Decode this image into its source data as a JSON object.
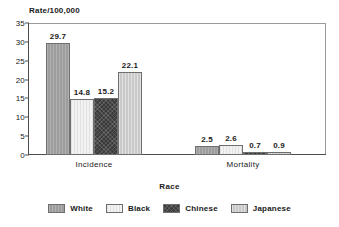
{
  "chart_data": {
    "type": "bar",
    "title": "",
    "xlabel": "Race",
    "ylabel": "Rate/100,000",
    "categories": [
      "Incidence",
      "Mortality"
    ],
    "series": [
      {
        "name": "White",
        "values": [
          29.7,
          2.5
        ],
        "color": "#9d9d9d",
        "pattern": "vertical-hatch"
      },
      {
        "name": "Black",
        "values": [
          14.8,
          2.6
        ],
        "color": "#f2f2f2",
        "pattern": "light"
      },
      {
        "name": "Chinese",
        "values": [
          15.2,
          0.7
        ],
        "color": "#3a3a3a",
        "pattern": "cross-hatch"
      },
      {
        "name": "Japanese",
        "values": [
          22.1,
          0.9
        ],
        "color": "#c9c9c9",
        "pattern": "vertical-line"
      }
    ],
    "ylim": [
      0,
      35
    ],
    "yticks": [
      0,
      5,
      10,
      15,
      20,
      25,
      30,
      35
    ],
    "ytick_labels": [
      "0",
      "5",
      "10",
      "15",
      "20",
      "25",
      "30",
      "35"
    ],
    "grid": false,
    "legend_position": "bottom",
    "legend_title": "Race",
    "data_labels": [
      "29.7",
      "14.8",
      "15.2",
      "22.1",
      "2.5",
      "2.6",
      "0.7",
      "0.9"
    ]
  },
  "axis": {
    "y_title": "Rate/100,000",
    "x_title": "Race"
  },
  "legend": {
    "title": "Race",
    "items": [
      {
        "label": "White"
      },
      {
        "label": "Black"
      },
      {
        "label": "Chinese"
      },
      {
        "label": "Japanese"
      }
    ]
  }
}
